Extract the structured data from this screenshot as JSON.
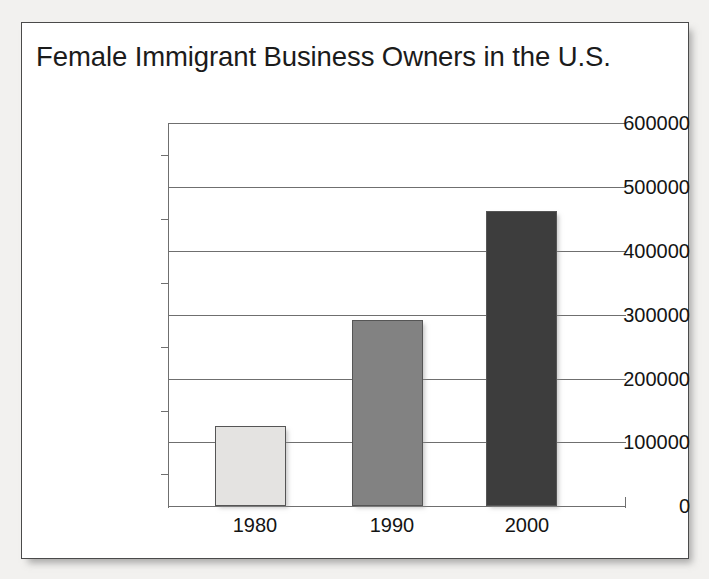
{
  "chart_data": {
    "type": "bar",
    "title": "Female Immigrant Business Owners in the U.S.",
    "xlabel": "",
    "ylabel": "",
    "categories": [
      "1980",
      "1990",
      "2000"
    ],
    "values": [
      125000,
      292000,
      462000
    ],
    "series": [
      {
        "name": "Female Immigrant Business Owners",
        "values": [
          125000,
          292000,
          462000
        ]
      }
    ],
    "ylim": [
      0,
      600000
    ],
    "ytick_labels": [
      "0",
      "100000",
      "200000",
      "300000",
      "400000",
      "500000",
      "600000"
    ],
    "ytick_values": [
      0,
      100000,
      200000,
      300000,
      400000,
      500000,
      600000
    ],
    "yminor_tick_interval": 50000,
    "grid": true,
    "legend": false,
    "legend_position": "none",
    "bar_colors": [
      "#e4e3e1",
      "#828282",
      "#3d3d3d"
    ],
    "bar_border_color": "#555555",
    "axis_color": "#6f6f6f",
    "text_color": "#141414",
    "background_color": "#ffffff",
    "page_background_color": "#f2f1ef"
  },
  "figure": {
    "title": "Female Immigrant Business Owners in the U.S.",
    "frame_border_color": "#4a4a4a"
  },
  "y_axis": {
    "ticks": [
      {
        "label": "600000",
        "value": 600000
      },
      {
        "label": "500000",
        "value": 500000
      },
      {
        "label": "400000",
        "value": 400000
      },
      {
        "label": "300000",
        "value": 300000
      },
      {
        "label": "200000",
        "value": 200000
      },
      {
        "label": "100000",
        "value": 100000
      },
      {
        "label": "0",
        "value": 0
      }
    ]
  },
  "x_axis": {
    "ticks": [
      {
        "label": "1980"
      },
      {
        "label": "1990"
      },
      {
        "label": "2000"
      }
    ]
  },
  "bars": [
    {
      "category": "1980",
      "value": 125000,
      "color": "#e4e3e1"
    },
    {
      "category": "1990",
      "value": 292000,
      "color": "#828282"
    },
    {
      "category": "2000",
      "value": 462000,
      "color": "#3d3d3d"
    }
  ]
}
